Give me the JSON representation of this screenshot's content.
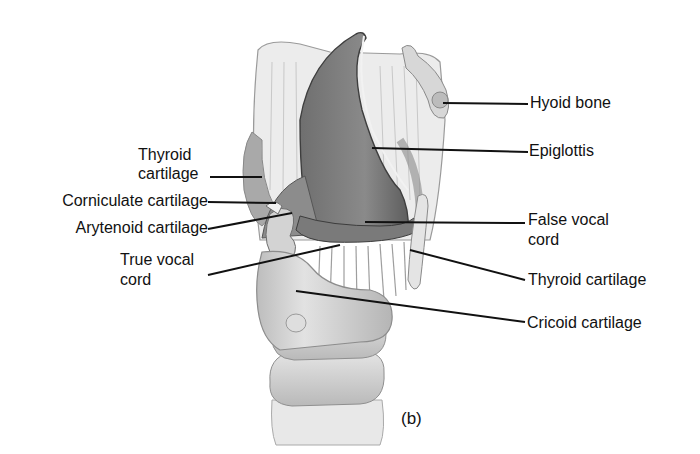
{
  "figure": {
    "panel_label": "(b)"
  },
  "labels": {
    "hyoid_bone": "Hyoid bone",
    "epiglottis": "Epiglottis",
    "thyroid_cartilage_left_line1": "Thyroid",
    "thyroid_cartilage_left_line2": "cartilage",
    "corniculate_cartilage": "Corniculate cartilage",
    "arytenoid_cartilage": "Arytenoid cartilage",
    "true_vocal_cord_line1": "True vocal",
    "true_vocal_cord_line2": "cord",
    "false_vocal_cord_line1": "False vocal",
    "false_vocal_cord_line2": "cord",
    "thyroid_cartilage_right": "Thyroid cartilage",
    "cricoid_cartilage": "Cricoid cartilage"
  },
  "colors": {
    "background": "#ffffff",
    "text": "#111111",
    "leader_line": "#111111",
    "epiglottis_fill": "#7e7e7e",
    "cartilage_fill": "#d6d6d6",
    "light_tissue": "#eeeeee",
    "shadow": "#9a9a9a"
  }
}
